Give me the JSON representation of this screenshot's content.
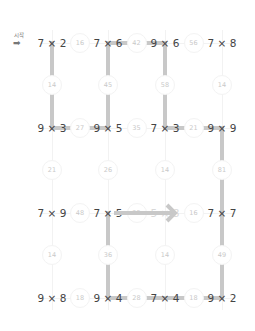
{
  "start": {
    "label": "시작",
    "icon": "right-arrow-icon"
  },
  "cells": [
    [
      "7 × 2",
      "7 × 6",
      "9 × 6",
      "7 × 8"
    ],
    null,
    [
      "9 × 3",
      "9 × 5",
      "7 × 3",
      "9 × 9"
    ],
    null,
    [
      "7 × 9",
      "7 × 5",
      "5 × 8",
      "7 × 7"
    ],
    null,
    [
      "9 × 8",
      "9 × 4",
      "7 × 4",
      "9 × 2"
    ]
  ],
  "horizontal_bubbles": {
    "row0": [
      "16",
      "42",
      "56"
    ],
    "row2": [
      "27",
      "35",
      "21"
    ],
    "row4": [
      "48",
      "35",
      "16"
    ],
    "row6": [
      "18",
      "28",
      "18"
    ]
  },
  "vertical_bubbles": {
    "row1": [
      "14",
      "45",
      "58",
      "14"
    ],
    "row3": [
      "21",
      "26",
      "14",
      "81"
    ],
    "row5": [
      "14",
      "36",
      "14",
      "49"
    ]
  },
  "colors": {
    "path": "#c8c8c8",
    "text": "#444444",
    "bubble_text": "#c9c9c9"
  }
}
